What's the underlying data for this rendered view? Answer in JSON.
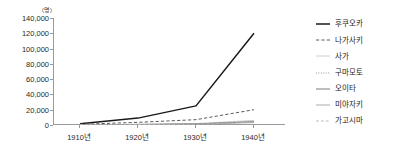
{
  "chart_data": {
    "type": "line",
    "title": "",
    "subtitle": "",
    "unit_label": "(명)",
    "xlabel": "",
    "ylabel": "",
    "x": [
      "1910년",
      "1920년",
      "1930년",
      "1940년"
    ],
    "xtick_labels": [
      "1910년",
      "1920년",
      "1930년",
      "1940년"
    ],
    "ytick_labels": [
      "0",
      "20,000",
      "40,000",
      "60,000",
      "80,000",
      "100,000",
      "120,000",
      "140,000"
    ],
    "ytick_values": [
      0,
      20000,
      40000,
      60000,
      80000,
      100000,
      120000,
      140000
    ],
    "ylim": [
      0,
      140000
    ],
    "grid": false,
    "legend_position": "right",
    "series": [
      {
        "name": "후쿠오카",
        "values": [
          1500,
          9000,
          25000,
          120000
        ],
        "style": "solid",
        "color": "#1a1a1a",
        "width": 1.5
      },
      {
        "name": "나가사키",
        "values": [
          900,
          3500,
          7000,
          20000
        ],
        "style": "dashed",
        "color": "#5a5a5a",
        "width": 1.0
      },
      {
        "name": "사가",
        "values": [
          300,
          900,
          1800,
          6000
        ],
        "style": "solid-light",
        "color": "#c8c8c8",
        "width": 0.9
      },
      {
        "name": "구마모토",
        "values": [
          300,
          800,
          1600,
          5000
        ],
        "style": "dotted",
        "color": "#8a8a8a",
        "width": 0.9
      },
      {
        "name": "오이타",
        "values": [
          250,
          700,
          1400,
          4200
        ],
        "style": "solid",
        "color": "#6e6e6e",
        "width": 0.9
      },
      {
        "name": "미야자키",
        "values": [
          200,
          500,
          1000,
          3200
        ],
        "style": "solid",
        "color": "#a0a0a0",
        "width": 0.9
      },
      {
        "name": "가고시마",
        "values": [
          200,
          600,
          1200,
          3800
        ],
        "style": "dashed",
        "color": "#b4b4b4",
        "width": 0.9
      }
    ]
  },
  "legend": {
    "items": [
      {
        "label": "후쿠오카"
      },
      {
        "label": "나가사키"
      },
      {
        "label": "사가"
      },
      {
        "label": "구마모토"
      },
      {
        "label": "오이타"
      },
      {
        "label": "미야자키"
      },
      {
        "label": "가고시마"
      }
    ]
  }
}
